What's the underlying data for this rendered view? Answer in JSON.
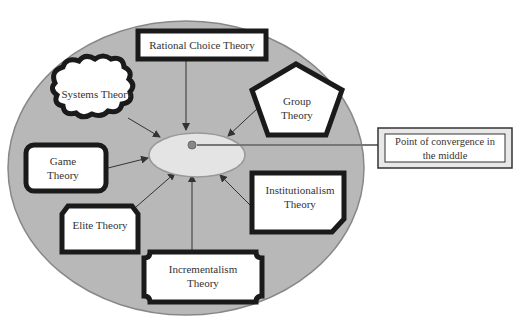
{
  "diagram": {
    "center_label": "Point of convergence in the middle",
    "nodes": [
      {
        "id": "rational",
        "label": "Rational Choice Theory",
        "shape": "thick-rectangle"
      },
      {
        "id": "systems",
        "label": "Systems Theory",
        "shape": "cloud"
      },
      {
        "id": "group",
        "label": "Group Theory",
        "shape": "pentagon"
      },
      {
        "id": "game",
        "label": "Game Theory",
        "shape": "rounded-rectangle"
      },
      {
        "id": "elite",
        "label": "Elite Theory",
        "shape": "snipped-rectangle"
      },
      {
        "id": "incremental",
        "label": "Incrementalism Theory",
        "shape": "plaque"
      },
      {
        "id": "institutional",
        "label": "Institutionalism Theory",
        "shape": "folded-corner"
      }
    ],
    "callout": {
      "label": "Point of convergence in the middle",
      "shape": "bevel"
    },
    "colors": {
      "circle_fill": "#b8b8b8",
      "circle_stroke": "#888888",
      "ellipse_fill": "#e4e4e4",
      "shape_stroke": "#1a1a1a",
      "arrow": "#333333"
    }
  }
}
